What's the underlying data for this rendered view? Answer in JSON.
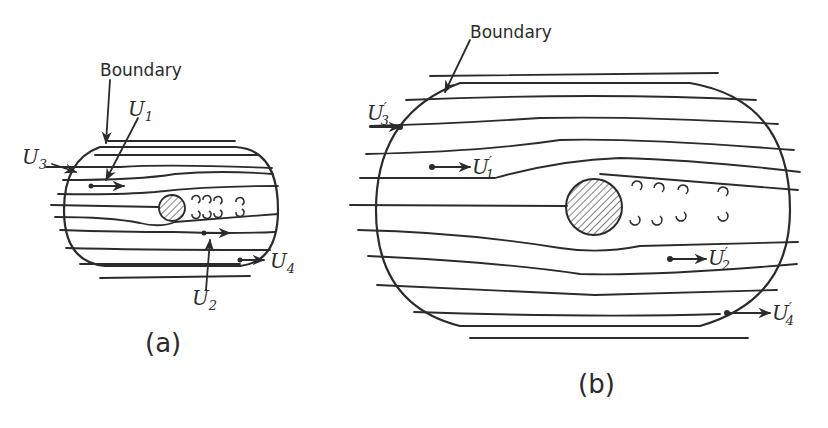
{
  "figure": {
    "panel_a": {
      "caption": "(a)",
      "boundary_label": "Boundary",
      "velocity_labels": {
        "u1": "U",
        "u1_sub": "1",
        "u2": "U",
        "u2_sub": "2",
        "u3": "U",
        "u3_sub": "3",
        "u4": "U",
        "u4_sub": "4"
      }
    },
    "panel_b": {
      "caption": "(b)",
      "boundary_label": "Boundary",
      "velocity_labels": {
        "u1": "U",
        "u1_sub": "1",
        "u1_prime": "′",
        "u2": "U",
        "u2_sub": "2",
        "u2_prime": "′",
        "u3": "U",
        "u3_sub": "3",
        "u3_prime": "′",
        "u4": "U",
        "u4_sub": "4",
        "u4_prime": "′"
      }
    },
    "colors": {
      "ink": "#2b2b2b",
      "background": "#ffffff"
    }
  }
}
